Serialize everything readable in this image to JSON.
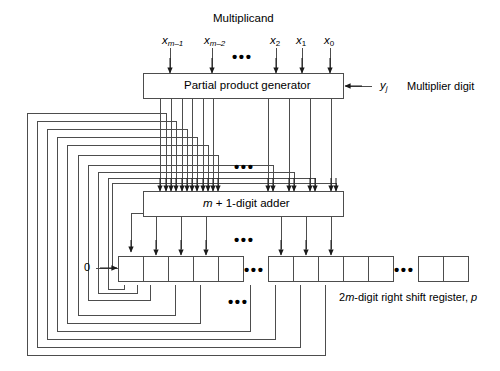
{
  "diagram": {
    "title_top": "Multiplicand",
    "inputs": [
      {
        "base": "x",
        "sub": "m–1"
      },
      {
        "base": "x",
        "sub": "m–2"
      },
      {
        "base": "x",
        "sub": "2"
      },
      {
        "base": "x",
        "sub": "1"
      },
      {
        "base": "x",
        "sub": "0"
      }
    ],
    "generator_box": {
      "label": "Partial product generator"
    },
    "multiplier_digit": {
      "symbol_base": "y",
      "symbol_sub": "j",
      "label": "Multiplier digit"
    },
    "adder_box": {
      "prefix": "m",
      "label": " + 1-digit adder"
    },
    "register": {
      "serial_in": "0",
      "caption_prefix": "2",
      "caption_italic": "m",
      "caption_rest": "-digit right shift register, ",
      "caption_var": "p"
    },
    "ellipsis": "•••",
    "colors": {
      "ink": "#1a1a1a",
      "line": "#4d4d4d",
      "background": "#ffffff"
    }
  }
}
